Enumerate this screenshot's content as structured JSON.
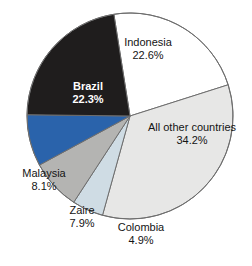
{
  "chart_data": {
    "type": "pie",
    "title": "",
    "subtitle": "",
    "xlabel": "",
    "ylabel": "",
    "legend_position": "none",
    "grid": false,
    "units": "percent",
    "total": 100.0,
    "start_angle_deg": -9,
    "direction": "clockwise",
    "categories": [
      "Indonesia",
      "All other countries",
      "Colombia",
      "Zaire",
      "Malaysia",
      "Brazil"
    ],
    "values": [
      22.6,
      34.2,
      4.9,
      7.9,
      8.1,
      22.3
    ],
    "value_labels": [
      "22.6%",
      "34.2%",
      "4.9%",
      "7.9%",
      "8.1%",
      "22.3%"
    ],
    "slices": [
      {
        "name": "Indonesia",
        "value": 22.6,
        "value_label": "22.6%",
        "color": "#ffffff",
        "label_placement": "inside",
        "text_color": "#141414"
      },
      {
        "name": "All other countries",
        "value": 34.2,
        "value_label": "34.2%",
        "color": "#e7e7e6",
        "label_placement": "inside",
        "text_color": "#141414"
      },
      {
        "name": "Colombia",
        "value": 4.9,
        "value_label": "4.9%",
        "color": "#cfdce4",
        "label_placement": "outside",
        "text_color": "#141414"
      },
      {
        "name": "Zaire",
        "value": 7.9,
        "value_label": "7.9%",
        "color": "#b4b4b2",
        "label_placement": "outside",
        "text_color": "#141414"
      },
      {
        "name": "Malaysia",
        "value": 8.1,
        "value_label": "8.1%",
        "color": "#2a63ab",
        "label_placement": "outside",
        "text_color": "#141414"
      },
      {
        "name": "Brazil",
        "value": 22.3,
        "value_label": "22.3%",
        "color": "#1f1d1d",
        "label_placement": "inside",
        "text_color": "#ffffff"
      }
    ],
    "colors": {
      "indonesia": "#ffffff",
      "all_other_countries": "#e7e7e6",
      "colombia": "#cfdce4",
      "zaire": "#b4b4b2",
      "malaysia": "#2a63ab",
      "brazil": "#1f1d1d",
      "outline": "#6e6e6e",
      "background": "#ffffff"
    }
  }
}
